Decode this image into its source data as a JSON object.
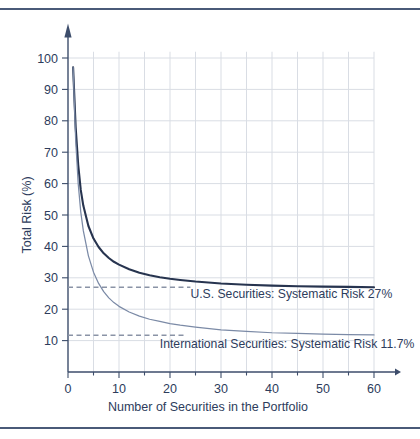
{
  "chart_data": {
    "type": "line",
    "title": "",
    "xlabel": "Number of Securities in the Portfolio",
    "ylabel": "Total Risk (%)",
    "xlim": [
      0,
      60
    ],
    "ylim": [
      0,
      105
    ],
    "xticks": [
      0,
      10,
      20,
      30,
      40,
      50,
      60
    ],
    "xtick_labels": [
      "0",
      "10",
      "20",
      "30",
      "40",
      "50",
      "60"
    ],
    "yticks": [
      10,
      20,
      30,
      40,
      50,
      60,
      70,
      80,
      90,
      100
    ],
    "ytick_labels": [
      "10",
      "20",
      "30",
      "40",
      "50",
      "60",
      "70",
      "80",
      "90",
      "100"
    ],
    "grid": true,
    "grid_x_step": 5,
    "grid_y_step": 10,
    "legend": "none",
    "series": [
      {
        "name": "U.S. Securities",
        "color": "#27344f",
        "asymptote": 27,
        "start_value": 97,
        "x": [
          1,
          1.5,
          2,
          2.5,
          3,
          4,
          5,
          6,
          7,
          8,
          9,
          10,
          12,
          14,
          16,
          18,
          20,
          22,
          25,
          30,
          35,
          40,
          45,
          50,
          55,
          60
        ],
        "y": [
          97,
          78,
          66,
          58,
          53,
          46.5,
          42.5,
          39.8,
          37.8,
          36.3,
          35.1,
          34.2,
          32.7,
          31.6,
          30.8,
          30.2,
          29.7,
          29.3,
          28.8,
          28.2,
          27.8,
          27.5,
          27.3,
          27.2,
          27.1,
          27.0
        ]
      },
      {
        "name": "International Securities",
        "color": "#7b8aa6",
        "asymptote": 11.7,
        "start_value": 97,
        "x": [
          1,
          1.5,
          2,
          2.5,
          3,
          4,
          5,
          6,
          7,
          8,
          9,
          10,
          12,
          14,
          16,
          18,
          20,
          22,
          25,
          30,
          35,
          40,
          45,
          50,
          55,
          60
        ],
        "y": [
          97,
          74,
          60,
          51,
          45,
          37,
          31.8,
          28.2,
          25.6,
          23.6,
          22.1,
          20.9,
          19.1,
          17.8,
          16.8,
          16.1,
          15.4,
          14.9,
          14.3,
          13.4,
          12.9,
          12.5,
          12.3,
          12.1,
          11.9,
          11.8
        ]
      }
    ],
    "reference_lines": [
      {
        "name": "us-systematic-risk",
        "value": 27,
        "style": "dashed",
        "color": "#8a93a6",
        "x_from": 0,
        "x_to": 24
      },
      {
        "name": "intl-systematic-risk",
        "value": 11.7,
        "style": "dashed",
        "color": "#8a93a6",
        "x_from": 0,
        "x_to": 23
      }
    ],
    "annotations": [
      {
        "name": "us-annotation",
        "text": "U.S. Securities:  Systematic Risk 27%",
        "x": 24,
        "y": 23.5
      },
      {
        "name": "intl-annotation",
        "text": "International Securities:  Systematic Risk 11.7%",
        "x": 18,
        "y": 7.5
      }
    ]
  },
  "axes": {
    "x_title": "Number of Securities in the Portfolio",
    "y_title": "Total Risk (%)"
  },
  "colors": {
    "rule": "#4a5a78",
    "axis": "#3d4d6b",
    "grid": "#d9dde4",
    "text": "#2d3c5c",
    "us_curve": "#27344f",
    "intl_curve": "#7b8aa6",
    "dashed": "#8a93a6"
  }
}
